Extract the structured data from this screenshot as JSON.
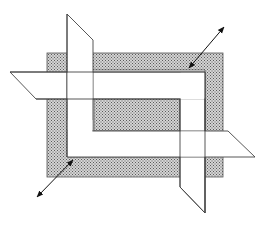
{
  "figure": {
    "colors": {
      "background": "#ffffff",
      "stipple_fill": "#c8c8c8",
      "stipple_dot": "#6a6a6a",
      "outline": "#444444",
      "strip_fill": "#ffffff",
      "arrow": "#111111"
    },
    "arrows": [
      {
        "name": "upper-right-arrow",
        "from": [
          189,
          68
        ],
        "to": [
          224,
          27
        ]
      },
      {
        "name": "lower-left-arrow",
        "from": [
          73,
          160
        ],
        "to": [
          37,
          197
        ]
      }
    ]
  }
}
